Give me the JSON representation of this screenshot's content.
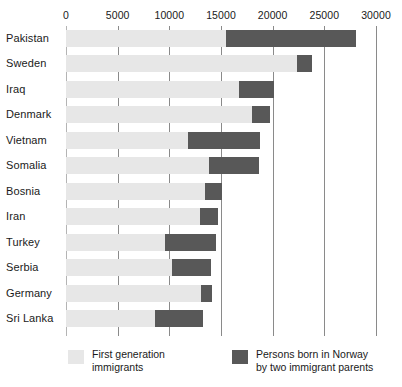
{
  "chart_data": {
    "type": "bar",
    "orientation": "horizontal",
    "stacked": true,
    "title": "",
    "subtitle": "",
    "xlabel": "",
    "ylabel": "",
    "xlim": [
      0,
      30000
    ],
    "xticks": [
      0,
      5000,
      10000,
      15000,
      20000,
      25000,
      30000
    ],
    "xtick_labels": [
      "0",
      "5000",
      "10000",
      "15000",
      "20000",
      "25000",
      "30000"
    ],
    "grid": true,
    "grid_axis": "x",
    "legend_position": "bottom",
    "categories": [
      "Pakistan",
      "Sweden",
      "Iraq",
      "Denmark",
      "Vietnam",
      "Somalia",
      "Bosnia",
      "Iran",
      "Turkey",
      "Serbia",
      "Germany",
      "Sri Lanka"
    ],
    "series": [
      {
        "name": "First generation immigrants",
        "color": "#e7e7e7",
        "values": [
          15500,
          22350,
          16750,
          18000,
          11800,
          13850,
          13450,
          12950,
          9600,
          10250,
          13050,
          8600
        ]
      },
      {
        "name": "Persons born in Norway by two immigrant parents",
        "color": "#585858",
        "values": [
          12550,
          1450,
          3400,
          1750,
          7000,
          4850,
          1650,
          1750,
          4900,
          3750,
          1050,
          4650
        ]
      }
    ],
    "totals": [
      28050,
      23800,
      20150,
      19750,
      18800,
      18700,
      15100,
      14700,
      14500,
      14000,
      14100,
      13250
    ]
  },
  "legend": {
    "entries": [
      {
        "swatch": "first",
        "line1": "First  generation",
        "line2": "immigrants"
      },
      {
        "swatch": "second",
        "line1": "Persons born in Norway",
        "line2": "by two immigrant parents"
      }
    ]
  },
  "colors": {
    "first_generation": "#e7e7e7",
    "norway_born": "#585858",
    "gridline": "#8a8a8a",
    "text": "#1a1a1a",
    "background": "#ffffff"
  }
}
